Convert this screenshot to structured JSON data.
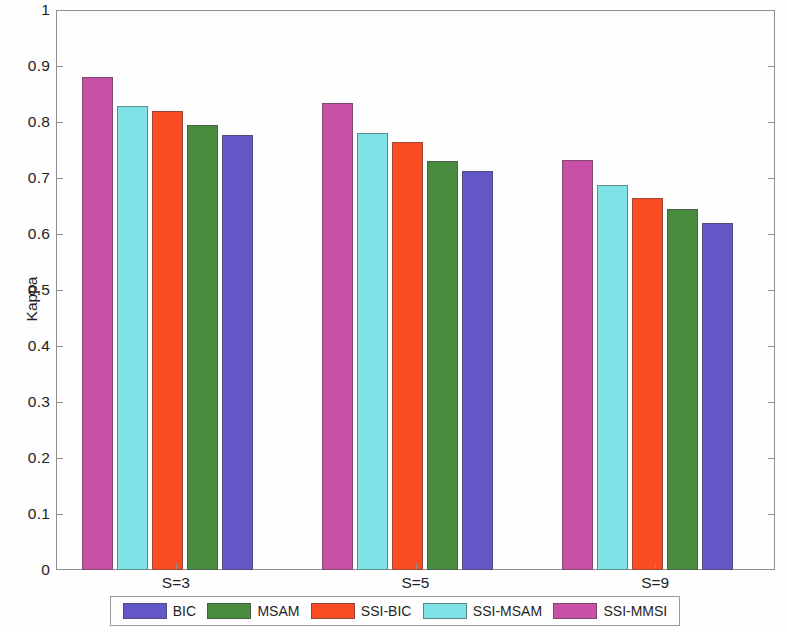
{
  "chart_data": {
    "type": "bar",
    "title": "",
    "xlabel": "",
    "ylabel": "Kappa",
    "ylim": [
      0,
      1
    ],
    "yticks": [
      "0",
      "0.1",
      "0.2",
      "0.3",
      "0.4",
      "0.5",
      "0.6",
      "0.7",
      "0.8",
      "0.9",
      "1"
    ],
    "ytick_values": [
      0,
      0.1,
      0.2,
      0.3,
      0.4,
      0.5,
      0.6,
      0.7,
      0.8,
      0.9,
      1
    ],
    "categories": [
      "S=3",
      "S=5",
      "S=9"
    ],
    "grid": false,
    "legend_position": "bottom",
    "bar_draw_order": [
      "SSI-MMSI",
      "SSI-MSAM",
      "SSI-BIC",
      "MSAM",
      "BIC"
    ],
    "series": [
      {
        "name": "BIC",
        "color": "#6457c8",
        "values": [
          0.777,
          0.712,
          0.619
        ]
      },
      {
        "name": "MSAM",
        "color": "#4a8c3f",
        "values": [
          0.795,
          0.731,
          0.645
        ]
      },
      {
        "name": "SSI-BIC",
        "color": "#fb4c24",
        "values": [
          0.819,
          0.764,
          0.665
        ]
      },
      {
        "name": "SSI-MSAM",
        "color": "#7fe3e8",
        "values": [
          0.829,
          0.781,
          0.687
        ]
      },
      {
        "name": "SSI-MMSI",
        "color": "#c851a7",
        "values": [
          0.88,
          0.834,
          0.733
        ]
      }
    ]
  },
  "legend": {
    "entries": [
      {
        "label": "BIC",
        "color": "#6457c8"
      },
      {
        "label": "MSAM",
        "color": "#4a8c3f"
      },
      {
        "label": "SSI-BIC",
        "color": "#fb4c24"
      },
      {
        "label": "SSI-MSAM",
        "color": "#7fe3e8"
      },
      {
        "label": "SSI-MMSI",
        "color": "#c851a7"
      }
    ]
  },
  "axis": {
    "y_label": "Kappa"
  }
}
